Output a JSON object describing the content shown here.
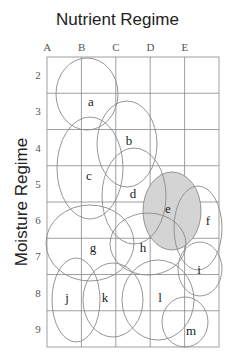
{
  "title": "Nutrient Regime",
  "y_axis_label": "Moisture Regime",
  "columns": [
    "A",
    "B",
    "C",
    "D",
    "E"
  ],
  "rows": [
    "2",
    "3",
    "4",
    "5",
    "6",
    "7",
    "8",
    "9"
  ],
  "colors": {
    "grid": "#888888",
    "ellipse_stroke": "#8a8a8a",
    "highlight_fill": "#d4d4d4"
  },
  "ellipses": [
    {
      "label": "a",
      "cx": 87,
      "cy": 94,
      "rx": 31,
      "ry": 36,
      "lx": 91,
      "ly": 106,
      "highlight": false
    },
    {
      "label": "b",
      "cx": 127,
      "cy": 144,
      "rx": 30,
      "ry": 43,
      "lx": 129,
      "ly": 145,
      "highlight": false
    },
    {
      "label": "c",
      "cx": 90,
      "cy": 168,
      "rx": 33,
      "ry": 51,
      "lx": 89,
      "ly": 180,
      "highlight": false
    },
    {
      "label": "d",
      "cx": 134,
      "cy": 196,
      "rx": 32,
      "ry": 48,
      "lx": 133,
      "ly": 198,
      "highlight": false
    },
    {
      "label": "e",
      "cx": 172,
      "cy": 211,
      "rx": 29,
      "ry": 39,
      "lx": 168,
      "ly": 213,
      "highlight": true
    },
    {
      "label": "f",
      "cx": 198,
      "cy": 228,
      "rx": 24,
      "ry": 42,
      "lx": 208,
      "ly": 225,
      "highlight": false
    },
    {
      "label": "g",
      "cx": 90,
      "cy": 243,
      "rx": 44,
      "ry": 38,
      "lx": 93,
      "ly": 252,
      "highlight": false
    },
    {
      "label": "h",
      "cx": 148,
      "cy": 244,
      "rx": 38,
      "ry": 31,
      "lx": 143,
      "ly": 252,
      "highlight": false
    },
    {
      "label": "i",
      "cx": 200,
      "cy": 269,
      "rx": 22,
      "ry": 27,
      "lx": 199,
      "ly": 274,
      "highlight": false
    },
    {
      "label": "j",
      "cx": 76,
      "cy": 300,
      "rx": 24,
      "ry": 42,
      "lx": 67,
      "ly": 302,
      "highlight": false
    },
    {
      "label": "k",
      "cx": 113,
      "cy": 300,
      "rx": 30,
      "ry": 37,
      "lx": 105,
      "ly": 302,
      "highlight": false
    },
    {
      "label": "l",
      "cx": 158,
      "cy": 300,
      "rx": 36,
      "ry": 40,
      "lx": 160,
      "ly": 302,
      "highlight": false
    },
    {
      "label": "m",
      "cx": 185,
      "cy": 322,
      "rx": 23,
      "ry": 25,
      "lx": 191,
      "ly": 335,
      "highlight": false
    }
  ]
}
